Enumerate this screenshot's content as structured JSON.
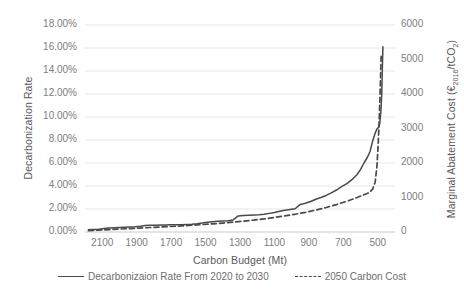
{
  "chart_data": {
    "type": "line",
    "title": "",
    "xlabel": "Carbon Budget (Mt)",
    "ylabel": "Decarbonization Rate",
    "y2label": "Marginal Abatement Cost (€2016/tCO2)",
    "y2label_parts": {
      "prefix": "Marginal Abatement Cost (€",
      "sub1": "2016",
      "mid": "/tCO",
      "sub2": "2",
      "suffix": ")"
    },
    "grid": true,
    "legend_position": "bottom",
    "xlim": [
      2200,
      400
    ],
    "x_reversed": true,
    "ylim": [
      0,
      0.18
    ],
    "y2lim": [
      0,
      6000
    ],
    "xticks": [
      "2100",
      "1900",
      "1700",
      "1500",
      "1300",
      "1100",
      "900",
      "700",
      "500"
    ],
    "xtick_values": [
      2100,
      1900,
      1700,
      1500,
      1300,
      1100,
      900,
      700,
      500
    ],
    "yticks": [
      "0.00%",
      "2.00%",
      "4.00%",
      "6.00%",
      "8.00%",
      "10.00%",
      "12.00%",
      "14.00%",
      "16.00%",
      "18.00%"
    ],
    "ytick_values": [
      0,
      0.02,
      0.04,
      0.06,
      0.08,
      0.1,
      0.12,
      0.14,
      0.16,
      0.18
    ],
    "y2ticks": [
      "0",
      "1000",
      "2000",
      "3000",
      "4000",
      "5000",
      "6000"
    ],
    "y2tick_values": [
      0,
      1000,
      2000,
      3000,
      4000,
      5000,
      6000
    ],
    "series": [
      {
        "name": "Decarbonizaion Rate From 2020 to 2030",
        "axis": "left",
        "style": "solid",
        "color": "#494949",
        "x": [
          2180,
          2150,
          2120,
          2090,
          2060,
          2030,
          2000,
          1970,
          1940,
          1910,
          1880,
          1850,
          1820,
          1790,
          1760,
          1730,
          1700,
          1670,
          1640,
          1610,
          1580,
          1550,
          1520,
          1490,
          1460,
          1430,
          1400,
          1370,
          1340,
          1310,
          1280,
          1250,
          1220,
          1190,
          1160,
          1130,
          1100,
          1070,
          1040,
          1010,
          980,
          950,
          920,
          890,
          860,
          830,
          800,
          770,
          740,
          710,
          680,
          650,
          620,
          600,
          580,
          560,
          545,
          530,
          515,
          505,
          495,
          488,
          482,
          477,
          473,
          470
        ],
        "y": [
          0.002,
          0.0022,
          0.0025,
          0.003,
          0.0034,
          0.0038,
          0.004,
          0.0042,
          0.0044,
          0.0046,
          0.005,
          0.0056,
          0.0058,
          0.0059,
          0.006,
          0.0061,
          0.0062,
          0.0063,
          0.0064,
          0.0066,
          0.0068,
          0.0072,
          0.0078,
          0.0085,
          0.009,
          0.0093,
          0.0095,
          0.0098,
          0.0105,
          0.014,
          0.0143,
          0.0145,
          0.0147,
          0.015,
          0.0155,
          0.0162,
          0.017,
          0.018,
          0.019,
          0.0196,
          0.0202,
          0.024,
          0.025,
          0.0265,
          0.0285,
          0.03,
          0.0318,
          0.034,
          0.0365,
          0.0395,
          0.042,
          0.0455,
          0.05,
          0.0545,
          0.06,
          0.065,
          0.07,
          0.079,
          0.086,
          0.0895,
          0.091,
          0.095,
          0.105,
          0.12,
          0.145,
          0.161
        ]
      },
      {
        "name": "2050 Carbon Cost",
        "axis": "right",
        "style": "dashed",
        "color": "#494949",
        "x": [
          2180,
          2120,
          2060,
          2000,
          1940,
          1880,
          1820,
          1760,
          1700,
          1640,
          1580,
          1520,
          1460,
          1400,
          1340,
          1280,
          1220,
          1160,
          1100,
          1040,
          980,
          920,
          860,
          800,
          740,
          680,
          620,
          580,
          550,
          530,
          515,
          505,
          498,
          492,
          487,
          483,
          480
        ],
        "y": [
          40,
          55,
          70,
          85,
          100,
          115,
          130,
          145,
          160,
          175,
          195,
          215,
          235,
          260,
          285,
          315,
          345,
          380,
          420,
          465,
          515,
          570,
          635,
          710,
          795,
          890,
          1000,
          1080,
          1140,
          1240,
          1450,
          1900,
          2500,
          3200,
          3950,
          4650,
          5150
        ]
      }
    ]
  },
  "legend": {
    "entries": [
      {
        "label": "Decarbonizaion Rate From 2020 to 2030",
        "style": "solid"
      },
      {
        "label": "2050 Carbon Cost",
        "style": "dashed"
      }
    ]
  }
}
